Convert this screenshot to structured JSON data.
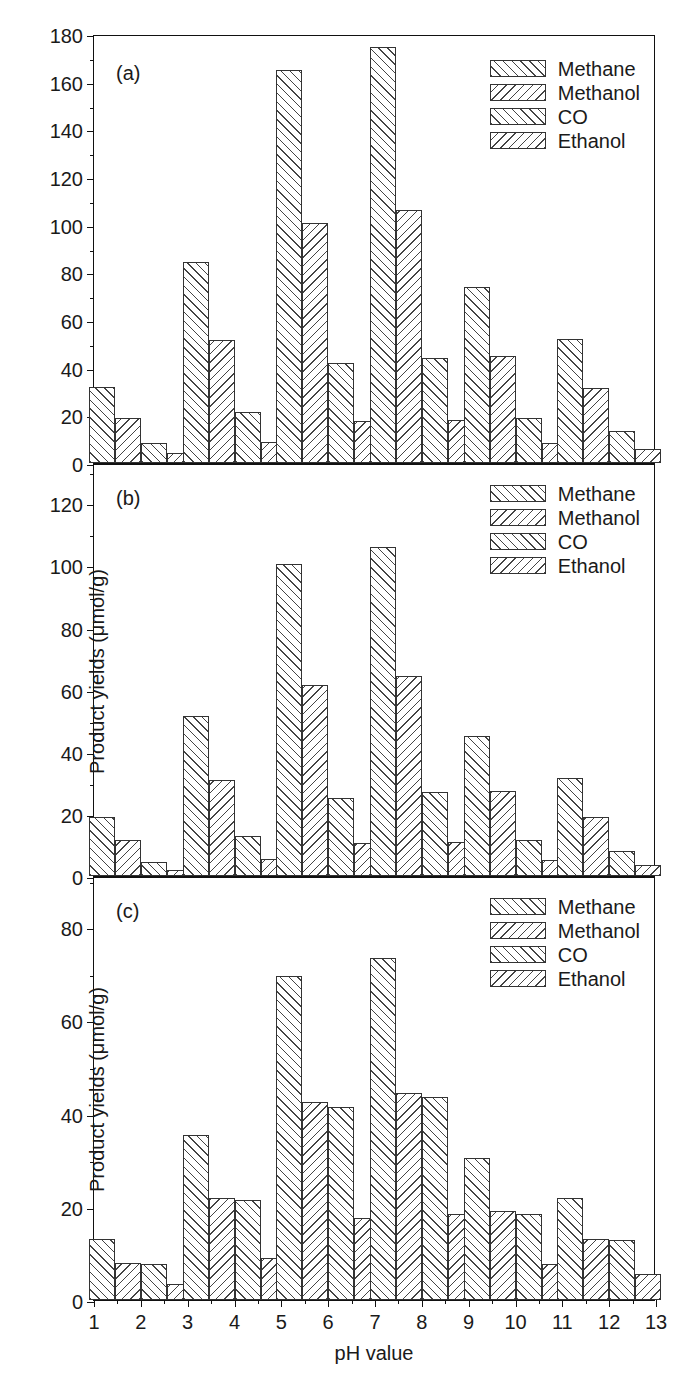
{
  "figure": {
    "axis_titles": {
      "x": "pH value",
      "y": "Product yields (μmol/g)"
    },
    "series_names": [
      "Methane",
      "Methanol",
      "CO",
      "Ethanol"
    ],
    "hatch_styles": [
      "forward-slash",
      "back-slash",
      "forward-slash",
      "back-slash"
    ],
    "panel_tags": [
      "(a)",
      "(b)",
      "(c)"
    ]
  },
  "chart_data": [
    {
      "type": "bar",
      "panel": "(a)",
      "title": "",
      "xlabel": "pH value",
      "ylabel": "",
      "categories": [
        2,
        4,
        6,
        8,
        10,
        12
      ],
      "xticklabels": [
        "1",
        "2",
        "3",
        "4",
        "5",
        "6",
        "7",
        "8",
        "9",
        "10",
        "11",
        "12",
        "13"
      ],
      "xlim": [
        1,
        13
      ],
      "ylim": [
        0,
        180
      ],
      "yticks": [
        0,
        20,
        40,
        60,
        80,
        100,
        120,
        140,
        160,
        180
      ],
      "yticklabels": [
        "0",
        "20",
        "40",
        "60",
        "80",
        "100",
        "120",
        "140",
        "160",
        "180"
      ],
      "grid": false,
      "legend_position": "top-right",
      "series": [
        {
          "name": "Methane",
          "values": [
            32,
            84.5,
            165,
            174.5,
            74,
            52
          ]
        },
        {
          "name": "Methanol",
          "values": [
            19,
            51.5,
            100.5,
            106,
            45,
            31.5
          ]
        },
        {
          "name": "CO",
          "values": [
            8.5,
            21.5,
            42,
            44,
            19,
            13.5
          ]
        },
        {
          "name": "Ethanol",
          "values": [
            4,
            9,
            17.5,
            18,
            8.5,
            6
          ]
        }
      ]
    },
    {
      "type": "bar",
      "panel": "(b)",
      "title": "",
      "xlabel": "pH value",
      "ylabel": "Product yields (μmol/g)",
      "categories": [
        2,
        4,
        6,
        8,
        10,
        12
      ],
      "xticklabels": [
        "1",
        "2",
        "3",
        "4",
        "5",
        "6",
        "7",
        "8",
        "9",
        "10",
        "11",
        "12",
        "13"
      ],
      "xlim": [
        1,
        13
      ],
      "ylim": [
        0,
        133
      ],
      "yticks": [
        0,
        20,
        40,
        60,
        80,
        100,
        120
      ],
      "yticklabels": [
        "0",
        "20",
        "40",
        "60",
        "80",
        "100",
        "120"
      ],
      "grid": false,
      "legend_position": "top-right",
      "series": [
        {
          "name": "Methane",
          "values": [
            19,
            51.5,
            100.5,
            106,
            45,
            31.5
          ]
        },
        {
          "name": "Methanol",
          "values": [
            11.5,
            31,
            61.5,
            64.5,
            27.5,
            19
          ]
        },
        {
          "name": "CO",
          "values": [
            4.5,
            13,
            25,
            27,
            11.5,
            8
          ]
        },
        {
          "name": "Ethanol",
          "values": [
            2,
            5.5,
            10.5,
            11,
            5,
            3.5
          ]
        }
      ]
    },
    {
      "type": "bar",
      "panel": "(c)",
      "title": "",
      "xlabel": "pH value",
      "ylabel": "Product yields (μmol/g)",
      "categories": [
        2,
        4,
        6,
        8,
        10,
        12
      ],
      "xticklabels": [
        "1",
        "2",
        "3",
        "4",
        "5",
        "6",
        "7",
        "8",
        "9",
        "10",
        "11",
        "12",
        "13"
      ],
      "xlim": [
        1,
        13
      ],
      "ylim": [
        0,
        91
      ],
      "yticks": [
        0,
        20,
        40,
        60,
        80
      ],
      "yticklabels": [
        "0",
        "20",
        "40",
        "60",
        "80"
      ],
      "grid": false,
      "legend_position": "top-right",
      "series": [
        {
          "name": "Methane",
          "values": [
            13,
            35.5,
            69.5,
            73.5,
            30.5,
            22
          ]
        },
        {
          "name": "Methanol",
          "values": [
            8,
            22,
            42.5,
            44.5,
            19,
            13
          ]
        },
        {
          "name": "CO",
          "values": [
            7.8,
            21.5,
            41.5,
            43.5,
            18.5,
            12.8
          ]
        },
        {
          "name": "Ethanol",
          "values": [
            3.5,
            9,
            17.5,
            18.5,
            7.8,
            5.5
          ]
        }
      ]
    }
  ]
}
